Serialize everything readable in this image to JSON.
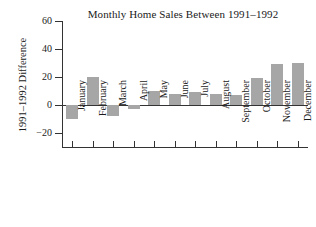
{
  "chart_data": {
    "type": "bar",
    "title": "Monthly Home Sales Between 1991–1992",
    "xlabel": "",
    "ylabel": "1991–1992 Difference",
    "categories": [
      "January",
      "February",
      "March",
      "April",
      "May",
      "June",
      "July",
      "August",
      "September",
      "October",
      "November",
      "December"
    ],
    "values": [
      -10,
      20,
      -8,
      -3,
      10,
      8,
      9,
      8,
      7.5,
      19,
      29,
      30
    ],
    "ylim": [
      -20,
      60
    ],
    "yticks": [
      60,
      40,
      20,
      0,
      -20
    ],
    "ytick_labels": [
      "60",
      "40",
      "20",
      "0",
      "−20"
    ],
    "grid": false,
    "legend": false,
    "bar_color": "#a6a6a6",
    "axis_color": "#333333",
    "background": "#ffffff"
  }
}
